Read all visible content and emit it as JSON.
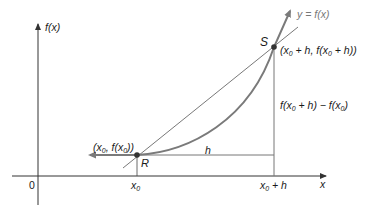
{
  "diagram": {
    "y_axis_label": "f(x)",
    "x_axis_label": "x",
    "origin_label": "0",
    "curve_label": "y = f(x)",
    "point_R": {
      "name": "R",
      "coords_label": "(x0, f(x0))"
    },
    "point_S": {
      "name": "S",
      "coords_label": "(x0 + h, f(x0 + h))"
    },
    "h_label": "h",
    "rise_label": "f(x0 + h) − f(x0)",
    "x_ticks": [
      "x0",
      "x0 + h"
    ],
    "colors": {
      "curve": "#7a7a7a",
      "axis": "#333333",
      "secant": "#555555",
      "point": "#333333"
    }
  }
}
